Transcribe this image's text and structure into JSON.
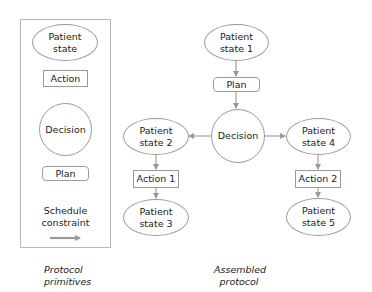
{
  "primitives_panel": {
    "caption": "Protocol\nprimitives",
    "items": [
      {
        "shape": "ellipse",
        "label": "Patient\nstate"
      },
      {
        "shape": "rect",
        "label": "Action"
      },
      {
        "shape": "circle",
        "label": "Decision"
      },
      {
        "shape": "rounded-rect",
        "label": "Plan"
      },
      {
        "shape": "arrow",
        "label": "Schedule\nconstraint"
      }
    ]
  },
  "assembled_protocol": {
    "caption": "Assembled\nprotocol",
    "nodes": {
      "patient_state_1": "Patient\nstate 1",
      "plan": "Plan",
      "decision": "Decision",
      "patient_state_2": "Patient\nstate 2",
      "patient_state_4": "Patient\nstate 4",
      "action_1": "Action 1",
      "action_2": "Action 2",
      "patient_state_3": "Patient\nstate 3",
      "patient_state_5": "Patient\nstate 5"
    },
    "edges": [
      [
        "patient_state_1",
        "plan"
      ],
      [
        "plan",
        "decision"
      ],
      [
        "decision",
        "patient_state_2"
      ],
      [
        "decision",
        "patient_state_4"
      ],
      [
        "patient_state_2",
        "action_1"
      ],
      [
        "action_1",
        "patient_state_3"
      ],
      [
        "patient_state_4",
        "action_2"
      ],
      [
        "action_2",
        "patient_state_5"
      ]
    ]
  },
  "colors": {
    "border": "#9a9a9a",
    "arrow": "#999999",
    "panel_border": "#b8b8b8",
    "text": "#222222"
  }
}
